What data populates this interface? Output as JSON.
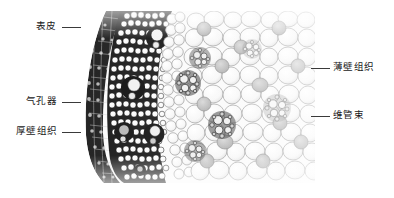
{
  "figure": {
    "type": "micrograph",
    "colors": {
      "background": "#ffffff",
      "leader_line": "#3a3a3a",
      "label_text": "#1a1a1a",
      "epidermis_dark": "#2b2b2b",
      "sclerenchyma_dark": "#3c3c3c",
      "parenchyma_light": "#f2f2f2",
      "cell_wall": "#9a9a9a",
      "vascular_mid": "#b4b4b4"
    }
  },
  "labels": {
    "left": [
      {
        "id": "epidermis",
        "text": "表皮"
      },
      {
        "id": "stomata",
        "text": "气孔器"
      },
      {
        "id": "sclerenchyma",
        "text": "厚壁组织"
      }
    ],
    "right": [
      {
        "id": "parenchyma",
        "text": "薄壁组织"
      },
      {
        "id": "vascular-bundle",
        "text": "维管束"
      }
    ]
  }
}
